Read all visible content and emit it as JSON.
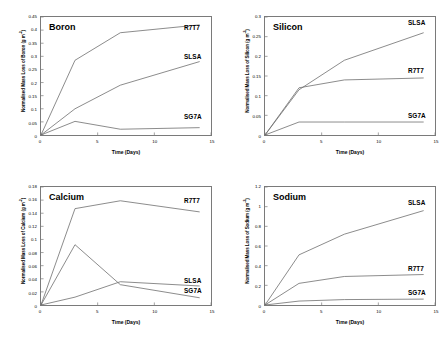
{
  "figure": {
    "panels": [
      "boron",
      "silicon",
      "calcium",
      "sodium"
    ]
  },
  "chart_data": [
    {
      "type": "line",
      "title": "Boron",
      "xlabel": "Time (Days)",
      "ylabel": "Normalised Mass Loss of Boron (g m-2)",
      "ylabel_base": "Normalised Mass Loss of Boron (g m",
      "ylabel_sup": "-2",
      "ylabel_close": ")",
      "xlim": [
        0,
        15
      ],
      "ylim": [
        0,
        0.45
      ],
      "xticks": [
        "0",
        "5",
        "10",
        "15"
      ],
      "xtickvals": [
        0,
        5,
        10,
        15
      ],
      "yticks": [
        "0",
        "0.05",
        "0.1",
        "0.15",
        "0.2",
        "0.25",
        "0.3",
        "0.35",
        "0.4",
        "0.45"
      ],
      "ytickvals": [
        0,
        0.05,
        0.1,
        0.15,
        0.2,
        0.25,
        0.3,
        0.35,
        0.4,
        0.45
      ],
      "grid": false,
      "legend_position": "inline-right",
      "x": [
        0,
        3,
        7,
        14
      ],
      "series": [
        {
          "name": "R7T7",
          "values": [
            0,
            0.285,
            0.39,
            0.42
          ],
          "label_y": 0.405
        },
        {
          "name": "SLSA",
          "values": [
            0,
            0.1,
            0.19,
            0.28
          ],
          "label_y": 0.297
        },
        {
          "name": "SG7A",
          "values": [
            0,
            0.052,
            0.022,
            0.028
          ],
          "label_y": 0.072
        }
      ]
    },
    {
      "type": "line",
      "title": "Silicon",
      "xlabel": "Time (Days)",
      "ylabel": "Normalised Mass Loss of Silicon (g m-2)",
      "ylabel_base": "Normalised Mass Loss of Silicon (g m",
      "ylabel_sup": "-2",
      "ylabel_close": ")",
      "xlim": [
        0,
        15
      ],
      "ylim": [
        0,
        0.3
      ],
      "xticks": [
        "0",
        "5",
        "10",
        "15"
      ],
      "xtickvals": [
        0,
        5,
        10,
        15
      ],
      "yticks": [
        "0",
        "0.05",
        "0.1",
        "0.15",
        "0.2",
        "0.25",
        "0.3"
      ],
      "ytickvals": [
        0,
        0.05,
        0.1,
        0.15,
        0.2,
        0.25,
        0.3
      ],
      "grid": false,
      "legend_position": "inline-right",
      "x": [
        0,
        3,
        7,
        14
      ],
      "series": [
        {
          "name": "SLSA",
          "values": [
            0,
            0.115,
            0.19,
            0.26
          ],
          "label_y": 0.283
        },
        {
          "name": "R7T7",
          "values": [
            0,
            0.12,
            0.14,
            0.145
          ],
          "label_y": 0.162
        },
        {
          "name": "SG7A",
          "values": [
            0,
            0.033,
            0.033,
            0.033
          ],
          "label_y": 0.049
        }
      ]
    },
    {
      "type": "line",
      "title": "Calcium",
      "xlabel": "Time (Days)",
      "ylabel": "Normalised Mass Loss of Calcium (g m-2)",
      "ylabel_base": "Normalised Mass Loss of Calcium (g m",
      "ylabel_sup": "-2",
      "ylabel_close": ")",
      "xlim": [
        0,
        15
      ],
      "ylim": [
        0,
        0.18
      ],
      "xticks": [
        "0",
        "5",
        "10",
        "15"
      ],
      "xtickvals": [
        0,
        5,
        10,
        15
      ],
      "yticks": [
        "0",
        "0.02",
        "0.04",
        "0.06",
        "0.08",
        "0.1",
        "0.12",
        "0.14",
        "0.16",
        "0.18"
      ],
      "ytickvals": [
        0,
        0.02,
        0.04,
        0.06,
        0.08,
        0.1,
        0.12,
        0.14,
        0.16,
        0.18
      ],
      "grid": false,
      "legend_position": "inline-right",
      "x": [
        0,
        3,
        7,
        14
      ],
      "series": [
        {
          "name": "R7T7",
          "values": [
            0,
            0.147,
            0.159,
            0.142
          ],
          "label_y": 0.158
        },
        {
          "name": "SLSA",
          "values": [
            0,
            0.012,
            0.0355,
            0.029
          ],
          "label_y": 0.037
        },
        {
          "name": "SG7A",
          "values": [
            0,
            0.092,
            0.031,
            0.011
          ],
          "label_y": 0.023
        }
      ]
    },
    {
      "type": "line",
      "title": "Sodium",
      "xlabel": "Time (Days)",
      "ylabel": "Normalised Mass Loss of Sodium (g m-2)",
      "ylabel_base": "Normalised Mass Loss of Sodium (g m",
      "ylabel_sup": "-2",
      "ylabel_close": ")",
      "xlim": [
        0,
        15
      ],
      "ylim": [
        0,
        1.2
      ],
      "xticks": [
        "0",
        "5",
        "10",
        "15"
      ],
      "xtickvals": [
        0,
        5,
        10,
        15
      ],
      "yticks": [
        "0",
        "0.2",
        "0.4",
        "0.6",
        "0.8",
        "1",
        "1.2"
      ],
      "ytickvals": [
        0,
        0.2,
        0.4,
        0.6,
        0.8,
        1,
        1.2
      ],
      "grid": false,
      "legend_position": "inline-right",
      "x": [
        0,
        3,
        7,
        14
      ],
      "series": [
        {
          "name": "SLSA",
          "values": [
            0,
            0.51,
            0.72,
            0.96
          ],
          "label_y": 1.03
        },
        {
          "name": "R7T7",
          "values": [
            0,
            0.22,
            0.29,
            0.31
          ],
          "label_y": 0.37
        },
        {
          "name": "SG7A",
          "values": [
            0,
            0.04,
            0.055,
            0.06
          ],
          "label_y": 0.13
        }
      ]
    }
  ]
}
